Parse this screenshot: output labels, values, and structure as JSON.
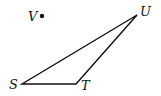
{
  "diagram": {
    "type": "geometry",
    "points": {
      "S": {
        "label": "S",
        "x": 22,
        "y": 84
      },
      "T": {
        "label": "T",
        "x": 76,
        "y": 84
      },
      "U": {
        "label": "U",
        "x": 137,
        "y": 15
      },
      "V": {
        "label": "V",
        "x": 42,
        "y": 16
      }
    },
    "segments": [
      [
        "S",
        "T"
      ],
      [
        "T",
        "U"
      ],
      [
        "U",
        "S"
      ]
    ],
    "stroke_color": "#111111"
  }
}
